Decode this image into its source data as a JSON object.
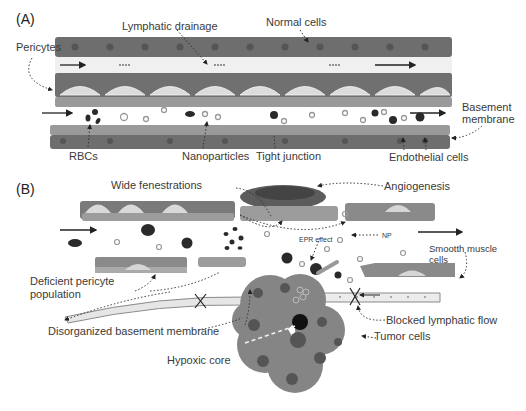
{
  "panel_a": {
    "tag": "(A)",
    "labels": {
      "lymphatic_drainage": "Lymphatic drainage",
      "normal_cells": "Normal cells",
      "pericytes": "Pericytes",
      "basement_membrane_line1": "Basement",
      "basement_membrane_line2": "membrane",
      "rbcs": "RBCs",
      "nanoparticles": "Nanoparticles",
      "tight_junction": "Tight junction",
      "endothelial_cells": "Endothelial cells"
    }
  },
  "panel_b": {
    "tag": "(B)",
    "labels": {
      "wide_fenestrations": "Wide fenestrations",
      "angiogenesis": "Angiogenesis",
      "epr_effect": "EPR effect",
      "np": "NP",
      "smooth_muscle_line1": "Smootth muscle",
      "smooth_muscle_line2": "cells",
      "deficient_pericyte_line1": "Deficient pericyte",
      "deficient_pericyte_line2": "population",
      "disorganized_bm": "Disorganized basement membrane",
      "blocked_lymphatic": "Blocked lymphatic flow",
      "tumor_cells": "Tumor cells",
      "hypoxic_core": "Hypoxic core"
    }
  },
  "colors": {
    "cell_dark": "#6e6e6e",
    "cell_mid": "#8a8a8a",
    "cell_light": "#a8a8a8",
    "nucleus": "#555555",
    "lumen": "#f3f3f3",
    "rbc": "#2a2a2a",
    "np_ring": "#9a9a9a",
    "tumor": "#858585",
    "arrow": "#222222"
  }
}
